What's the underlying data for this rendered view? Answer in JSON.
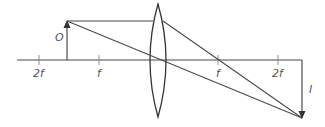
{
  "diagram": {
    "colors": {
      "line": "#4a4a4a",
      "label": "#555555",
      "background": "#ffffff"
    },
    "labels": {
      "object": "O",
      "image": "I",
      "left_2f": "2f",
      "left_f": "f",
      "right_f": "f",
      "right_2f": "2f"
    }
  }
}
